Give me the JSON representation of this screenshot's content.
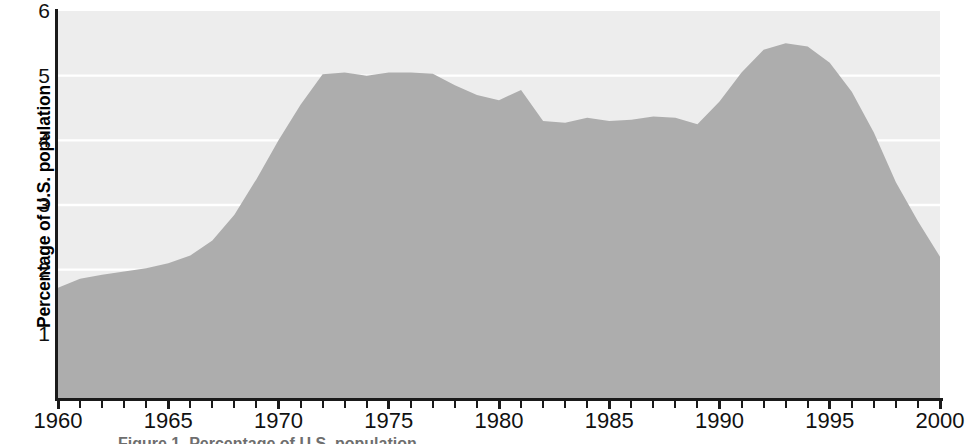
{
  "chart_data": {
    "type": "area",
    "title": "",
    "subtitle": "",
    "xlabel": "",
    "ylabel": "Percentage of U.S. population",
    "xlim": [
      1960,
      2000
    ],
    "ylim": [
      0,
      6
    ],
    "grid": "horizontal",
    "legend": "none",
    "y_ticks": [
      6,
      5,
      4,
      3,
      2,
      1
    ],
    "y_tick_labels": [
      "6",
      "5",
      "4",
      "3",
      "2",
      "1"
    ],
    "x_ticks": [
      1960,
      1965,
      1970,
      1975,
      1980,
      1985,
      1990,
      1995,
      2000
    ],
    "x_tick_labels": [
      "1960",
      "1965",
      "1970",
      "1975",
      "1980",
      "1985",
      "1990",
      "1995",
      "2000"
    ],
    "x_minor_tick_interval": 1,
    "series": [
      {
        "name": "Percentage of U.S. population",
        "fill_color": "#adadad",
        "x": [
          1960,
          1961,
          1962,
          1963,
          1964,
          1965,
          1966,
          1967,
          1968,
          1969,
          1970,
          1971,
          1972,
          1973,
          1974,
          1975,
          1976,
          1977,
          1978,
          1979,
          1980,
          1981,
          1982,
          1983,
          1984,
          1985,
          1986,
          1987,
          1988,
          1989,
          1990,
          1991,
          1992,
          1993,
          1994,
          1995,
          1996,
          1997,
          1998,
          1999,
          2000
        ],
        "values": [
          1.72,
          1.86,
          1.92,
          1.97,
          2.02,
          2.1,
          2.22,
          2.45,
          2.85,
          3.4,
          4.0,
          4.55,
          5.02,
          5.05,
          5.0,
          5.05,
          5.05,
          5.03,
          4.85,
          4.7,
          4.62,
          4.78,
          4.3,
          4.27,
          4.35,
          4.3,
          4.32,
          4.37,
          4.35,
          4.25,
          4.6,
          5.05,
          5.4,
          5.5,
          5.45,
          5.2,
          4.75,
          4.12,
          3.35,
          2.75,
          2.2
        ]
      }
    ]
  },
  "axis": {
    "y_title": "Percentage of U.S. population"
  },
  "caption": {
    "clipped_text": "Figure 1. Percentage of U.S. population"
  }
}
